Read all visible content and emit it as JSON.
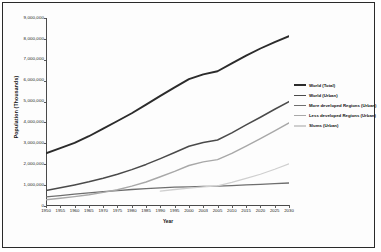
{
  "chart_data": {
    "type": "line",
    "title": "",
    "xlabel": "Year",
    "ylabel": "Population (Thousands)",
    "xlim": [
      1950,
      2030
    ],
    "ylim": [
      0,
      9000000
    ],
    "grid": false,
    "legend_position": "right",
    "x": [
      1950,
      1955,
      1960,
      1965,
      1970,
      1975,
      1980,
      1985,
      1990,
      1995,
      2000,
      2003,
      2005,
      2010,
      2015,
      2020,
      2025,
      2030
    ],
    "xtick_labels": [
      "1950",
      "1955",
      "1960",
      "1965",
      "1970",
      "1975",
      "1980",
      "1985",
      "1990",
      "1995",
      "2000",
      "2003",
      "2005",
      "2010",
      "2015",
      "2020",
      "2025",
      "2030"
    ],
    "ytick_labels": [
      "0",
      "1,000,000",
      "2,000,000",
      "3,000,000",
      "4,000,000",
      "5,000,000",
      "6,000,000",
      "7,000,000",
      "8,000,000",
      "9,000,000"
    ],
    "ytick_values": [
      0,
      1000000,
      2000000,
      3000000,
      4000000,
      5000000,
      6000000,
      7000000,
      8000000,
      9000000
    ],
    "series": [
      {
        "name": "World (Total)",
        "color": "#2b2b2b",
        "width": 1.9,
        "values": [
          2520000,
          2770000,
          3020000,
          3340000,
          3700000,
          4070000,
          4440000,
          4850000,
          5270000,
          5680000,
          6070000,
          6300000,
          6450000,
          6830000,
          7200000,
          7540000,
          7850000,
          8130000
        ]
      },
      {
        "name": "World (Urban)",
        "color": "#4a4a4a",
        "width": 1.5,
        "values": [
          740000,
          870000,
          1010000,
          1160000,
          1330000,
          1520000,
          1740000,
          1990000,
          2270000,
          2560000,
          2860000,
          3040000,
          3160000,
          3500000,
          3880000,
          4250000,
          4630000,
          5000000
        ]
      },
      {
        "name": "More developed Regions (Urban)",
        "color": "#6e6e6e",
        "width": 1.3,
        "values": [
          440000,
          500000,
          570000,
          630000,
          690000,
          740000,
          790000,
          830000,
          870000,
          900000,
          920000,
          940000,
          950000,
          980000,
          1010000,
          1040000,
          1070000,
          1100000
        ]
      },
      {
        "name": "Less developed Regions (Urban)",
        "color": "#a8a8a8",
        "width": 1.4,
        "values": [
          300000,
          370000,
          450000,
          540000,
          650000,
          780000,
          950000,
          1150000,
          1400000,
          1660000,
          1940000,
          2110000,
          2220000,
          2520000,
          2870000,
          3230000,
          3600000,
          3980000
        ]
      },
      {
        "name": "Slums (Urban)",
        "color": "#cfcfcf",
        "width": 1.3,
        "values": [
          null,
          null,
          null,
          null,
          null,
          null,
          null,
          null,
          715000,
          790000,
          860000,
          920000,
          960000,
          1130000,
          1320000,
          1520000,
          1760000,
          2020000
        ]
      }
    ]
  },
  "legend": {
    "items": [
      {
        "label": "World (Total)"
      },
      {
        "label": "World (Urban)"
      },
      {
        "label": "More developed Regions (Urban)"
      },
      {
        "label": "Less developed Regions (Urban)"
      },
      {
        "label": "Slums (Urban)"
      }
    ]
  },
  "axes": {
    "y_title": "Population (Thousands)",
    "x_title": "Year"
  }
}
